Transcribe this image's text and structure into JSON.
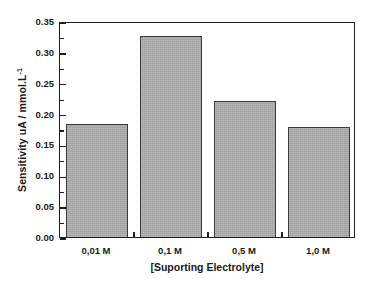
{
  "chart_data": {
    "type": "bar",
    "title": "",
    "categories": [
      "0,01 M",
      "0,1 M",
      "0,5 M",
      "1,0 M"
    ],
    "values": [
      0.183,
      0.326,
      0.22,
      0.179
    ],
    "xlabel": "[Suporting Electrolyte]",
    "ylabel_text": "Sensitivity uA / mmol.L",
    "ylabel_superscript": "-1",
    "ylim": [
      0.0,
      0.35
    ],
    "ytick_labels": [
      "0.00",
      "0.05",
      "0.10",
      "0.15",
      "0.20",
      "0.25",
      "0.30",
      "0.35"
    ],
    "ytick_values": [
      0.0,
      0.05,
      0.1,
      0.15,
      0.2,
      0.25,
      0.3,
      0.35
    ],
    "ytick_minor_step": 0.025,
    "grid": false,
    "legend": null,
    "bar_fill_color": "#a9a9a9",
    "bar_edge_color": "#3b3b3b",
    "axis_color": "#231f20",
    "background_color": "#ffffff"
  }
}
